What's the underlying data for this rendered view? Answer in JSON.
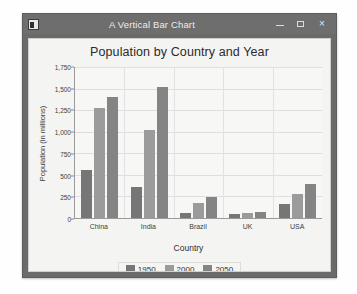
{
  "window": {
    "title": "A Vertical Bar Chart",
    "app_icon": "application-icon",
    "controls": {
      "minimize": "–",
      "maximize": "□",
      "close": "×"
    }
  },
  "chart_data": {
    "type": "bar",
    "title": "Population by Country and Year",
    "xlabel": "Country",
    "ylabel": "Population (in millions)",
    "categories": [
      "China",
      "India",
      "Brazil",
      "UK",
      "USA"
    ],
    "series": [
      {
        "name": "1950",
        "color": "#767676",
        "values": [
          554,
          360,
          54,
          45,
          158
        ]
      },
      {
        "name": "2000",
        "color": "#9b9b9b",
        "values": [
          1280,
          1020,
          175,
          59,
          282
        ]
      },
      {
        "name": "2050",
        "color": "#848484",
        "values": [
          1400,
          1520,
          240,
          67,
          400
        ]
      }
    ],
    "ylim": [
      0,
      1750
    ],
    "yticks": [
      0,
      250,
      500,
      750,
      1000,
      1250,
      1500,
      1750
    ],
    "ytick_labels": [
      "0",
      "250",
      "500",
      "750",
      "1,000",
      "1,250",
      "1,500",
      "1,750"
    ],
    "grid": true,
    "legend_position": "bottom"
  }
}
